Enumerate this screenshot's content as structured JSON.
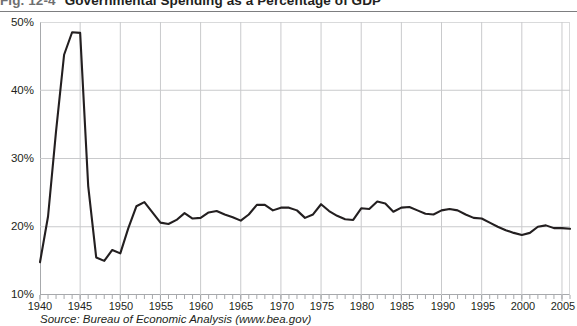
{
  "figure": {
    "number": "Fig. 12-4",
    "title": "Governmental Spending as a Percentage of GDP",
    "source": "Source: Bureau of Economic Analysis (www.bea.gov)"
  },
  "colors": {
    "line": "#231f20",
    "grid": "#c9cacc",
    "axis": "#a7a9ac",
    "text": "#231f20",
    "fig_number": "#6e6f71",
    "background": "#ffffff"
  },
  "axes": {
    "y_ticks": [
      "50%",
      "40%",
      "30%",
      "20%",
      "10%"
    ],
    "x_ticks": [
      "1940",
      "1945",
      "1950",
      "1955",
      "1960",
      "1965",
      "1970",
      "1975",
      "1980",
      "1985",
      "1990",
      "1995",
      "2000",
      "2005"
    ]
  },
  "chart_data": {
    "type": "line",
    "title": "Governmental Spending as a Percentage of GDP",
    "xlabel": "",
    "ylabel": "",
    "xlim": [
      1940,
      2006
    ],
    "ylim": [
      10,
      50
    ],
    "ytick_values": [
      10,
      20,
      30,
      40,
      50
    ],
    "ytick_labels": [
      "10%",
      "20%",
      "30%",
      "40%",
      "50%"
    ],
    "xtick_values": [
      1940,
      1945,
      1950,
      1955,
      1960,
      1965,
      1970,
      1975,
      1980,
      1985,
      1990,
      1995,
      2000,
      2005
    ],
    "xtick_labels": [
      "1940",
      "1945",
      "1950",
      "1955",
      "1960",
      "1965",
      "1970",
      "1975",
      "1980",
      "1985",
      "1990",
      "1995",
      "2000",
      "2005"
    ],
    "minor_x_tick_interval": 1,
    "grid": "vertical and horizontal major gridlines",
    "legend": "none",
    "series": [
      {
        "name": "Governmental spending as a percentage of GDP",
        "color": "#231f20",
        "x": [
          1940,
          1941,
          1942,
          1943,
          1944,
          1945,
          1946,
          1947,
          1948,
          1949,
          1950,
          1951,
          1952,
          1953,
          1954,
          1955,
          1956,
          1957,
          1958,
          1959,
          1960,
          1961,
          1962,
          1963,
          1964,
          1965,
          1966,
          1967,
          1968,
          1969,
          1970,
          1971,
          1972,
          1973,
          1974,
          1975,
          1976,
          1977,
          1978,
          1979,
          1980,
          1981,
          1982,
          1983,
          1984,
          1985,
          1986,
          1987,
          1988,
          1989,
          1990,
          1991,
          1992,
          1993,
          1994,
          1995,
          1996,
          1997,
          1998,
          1999,
          2000,
          2001,
          2002,
          2003,
          2004,
          2005,
          2006
        ],
        "y": [
          14.8,
          21.5,
          34.0,
          45.2,
          48.5,
          48.4,
          26.0,
          15.5,
          15.0,
          16.6,
          16.1,
          19.8,
          23.0,
          23.6,
          22.1,
          20.6,
          20.4,
          21.0,
          22.0,
          21.2,
          21.3,
          22.1,
          22.3,
          21.8,
          21.4,
          20.9,
          21.8,
          23.2,
          23.2,
          22.4,
          22.8,
          22.8,
          22.4,
          21.3,
          21.8,
          23.3,
          22.3,
          21.6,
          21.1,
          21.0,
          22.7,
          22.6,
          23.7,
          23.4,
          22.2,
          22.8,
          22.9,
          22.4,
          21.9,
          21.8,
          22.4,
          22.6,
          22.4,
          21.8,
          21.3,
          21.2,
          20.6,
          20.0,
          19.5,
          19.1,
          18.8,
          19.1,
          20.0,
          20.2,
          19.8,
          19.8,
          19.7
        ]
      }
    ]
  }
}
